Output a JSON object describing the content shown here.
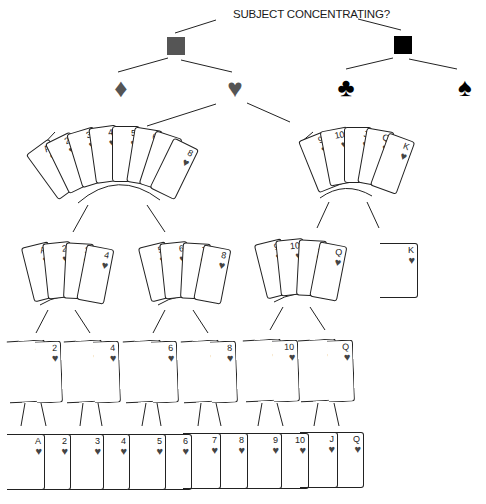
{
  "title": "SUBJECT CONCENTRATING?",
  "colors": {
    "gray": "#555555",
    "black": "#000000",
    "heart": "#555555",
    "line": "#222222"
  },
  "level1": [
    {
      "name": "gray-square",
      "color": "#555555"
    },
    {
      "name": "black-square",
      "color": "#000000"
    }
  ],
  "suits": [
    {
      "name": "diamond",
      "glyph": "♦"
    },
    {
      "name": "heart",
      "glyph": "♥"
    },
    {
      "name": "club",
      "glyph": "♣"
    },
    {
      "name": "spade",
      "glyph": "♠"
    }
  ],
  "groups": {
    "fan_low": [
      "A",
      "2",
      "3",
      "4",
      "5",
      "6",
      "7",
      "8"
    ],
    "fan_high": [
      "9",
      "10",
      "J",
      "Q",
      "K"
    ],
    "quads": [
      [
        "A",
        "2",
        "3",
        "4"
      ],
      [
        "5",
        "6",
        "7",
        "8"
      ],
      [
        "9",
        "10",
        "J",
        "Q"
      ]
    ],
    "single": [
      "K"
    ],
    "pairs": [
      [
        "A",
        "2"
      ],
      [
        "3",
        "4"
      ],
      [
        "5",
        "6"
      ],
      [
        "7",
        "8"
      ],
      [
        "9",
        "10"
      ],
      [
        "J",
        "Q"
      ]
    ],
    "singles": [
      "A",
      "2",
      "3",
      "4",
      "5",
      "6",
      "7",
      "8",
      "9",
      "10",
      "J",
      "Q"
    ]
  },
  "pip": "♥"
}
